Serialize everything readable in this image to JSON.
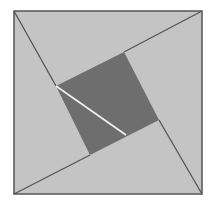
{
  "diagram": {
    "title": "",
    "width": 211,
    "height": 205,
    "background": "#ffffff",
    "colors": {
      "light_fill": "#c4c4c4",
      "dark_fill": "#6e6e6e",
      "stroke": "#555555",
      "highlight_line": "#f2f2f2"
    },
    "outer_square": {
      "points": [
        [
          14,
          11
        ],
        [
          202,
          11
        ],
        [
          202,
          194
        ],
        [
          14,
          194
        ]
      ]
    },
    "inner_square": {
      "points": [
        [
          124,
          52
        ],
        [
          159,
          120
        ],
        [
          90,
          155
        ],
        [
          56,
          86
        ]
      ]
    },
    "extension_lines": [
      {
        "from": [
          14,
          11
        ],
        "to": [
          56,
          86
        ]
      },
      {
        "from": [
          202,
          11
        ],
        "to": [
          124,
          52
        ]
      },
      {
        "from": [
          202,
          194
        ],
        "to": [
          159,
          120
        ]
      },
      {
        "from": [
          14,
          194
        ],
        "to": [
          90,
          155
        ]
      }
    ],
    "highlight_line": {
      "from": [
        56,
        86
      ],
      "to": [
        126,
        135
      ]
    }
  }
}
